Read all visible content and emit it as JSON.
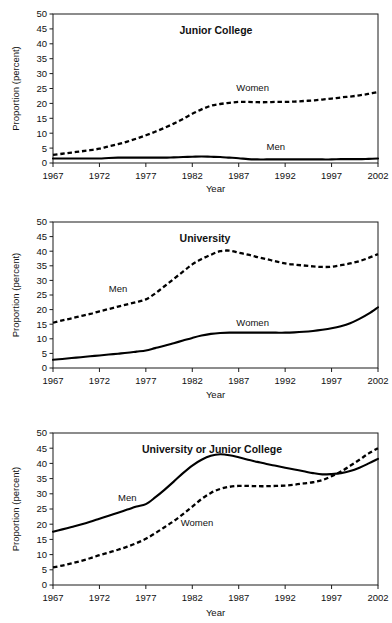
{
  "figure": {
    "background": "#ffffff",
    "line_color": "#000000",
    "axis_color": "#1b1b1b",
    "panel_count": 3
  },
  "shared": {
    "xlabel": "Year",
    "ylabel": "Proportion (percent)",
    "xticks": [
      "1967",
      "1972",
      "1977",
      "1982",
      "1987",
      "1992",
      "1997",
      "2002"
    ],
    "yticks": [
      "0",
      "5",
      "10",
      "15",
      "20",
      "25",
      "30",
      "35",
      "40",
      "45",
      "50"
    ]
  },
  "chart_data": [
    {
      "type": "line",
      "title": "Junior College",
      "xlabel": "Year",
      "ylabel": "Proportion (percent)",
      "xlim": [
        1967,
        2002
      ],
      "ylim": [
        0,
        50
      ],
      "xticks": [
        1967,
        1972,
        1977,
        1982,
        1987,
        1992,
        1997,
        2002
      ],
      "yticks": [
        0,
        5,
        10,
        15,
        20,
        25,
        30,
        35,
        40,
        45,
        50
      ],
      "grid": false,
      "legend_position": "inline-annotations",
      "x": [
        1967,
        1968,
        1969,
        1970,
        1971,
        1972,
        1973,
        1974,
        1975,
        1976,
        1977,
        1978,
        1979,
        1980,
        1981,
        1982,
        1983,
        1984,
        1985,
        1986,
        1987,
        1988,
        1989,
        1990,
        1991,
        1992,
        1993,
        1994,
        1995,
        1996,
        1997,
        1998,
        1999,
        2000,
        2001,
        2002
      ],
      "series": [
        {
          "name": "Women",
          "style": "dashed",
          "label_xy": [
            1988.5,
            24.0
          ],
          "values": [
            2.7,
            3.1,
            3.5,
            3.9,
            4.3,
            4.8,
            5.6,
            6.3,
            7.2,
            8.2,
            9.3,
            10.5,
            11.8,
            13.2,
            14.8,
            16.5,
            18.0,
            19.2,
            19.8,
            20.2,
            20.5,
            20.5,
            20.4,
            20.4,
            20.5,
            20.5,
            20.6,
            20.8,
            21.0,
            21.3,
            21.6,
            22.0,
            22.3,
            22.7,
            23.2,
            23.8
          ]
        },
        {
          "name": "Men",
          "style": "solid",
          "label_xy": [
            1991.0,
            4.2
          ],
          "values": [
            1.5,
            1.5,
            1.5,
            1.5,
            1.5,
            1.5,
            1.7,
            1.8,
            1.8,
            1.8,
            1.8,
            1.8,
            1.8,
            1.9,
            2.0,
            2.1,
            2.2,
            2.1,
            2.0,
            1.8,
            1.6,
            1.3,
            1.2,
            1.2,
            1.2,
            1.2,
            1.2,
            1.2,
            1.2,
            1.2,
            1.2,
            1.3,
            1.3,
            1.3,
            1.4,
            1.5
          ]
        }
      ]
    },
    {
      "type": "line",
      "title": "University",
      "xlabel": "Year",
      "ylabel": "Proportion (percent)",
      "xlim": [
        1967,
        2002
      ],
      "ylim": [
        0,
        50
      ],
      "xticks": [
        1967,
        1972,
        1977,
        1982,
        1987,
        1992,
        1997,
        2002
      ],
      "yticks": [
        0,
        5,
        10,
        15,
        20,
        25,
        30,
        35,
        40,
        45,
        50
      ],
      "grid": false,
      "legend_position": "inline-annotations",
      "x": [
        1967,
        1968,
        1969,
        1970,
        1971,
        1972,
        1973,
        1974,
        1975,
        1976,
        1977,
        1978,
        1979,
        1980,
        1981,
        1982,
        1983,
        1984,
        1985,
        1986,
        1987,
        1988,
        1989,
        1990,
        1991,
        1992,
        1993,
        1994,
        1995,
        1996,
        1997,
        1998,
        1999,
        2000,
        2001,
        2002
      ],
      "series": [
        {
          "name": "Men",
          "style": "dashed",
          "label_xy": [
            1974.0,
            26.0
          ],
          "values": [
            15.5,
            16.3,
            17.0,
            17.8,
            18.5,
            19.4,
            20.2,
            21.0,
            21.8,
            22.6,
            23.5,
            25.5,
            28.0,
            30.5,
            33.0,
            35.5,
            37.3,
            38.8,
            40.0,
            40.2,
            39.5,
            38.8,
            38.0,
            37.3,
            36.5,
            35.8,
            35.4,
            35.1,
            34.8,
            34.6,
            34.7,
            35.2,
            35.8,
            36.6,
            37.7,
            39.0
          ]
        },
        {
          "name": "Women",
          "style": "solid",
          "label_xy": [
            1988.5,
            14.5
          ],
          "values": [
            2.8,
            3.1,
            3.4,
            3.7,
            4.0,
            4.3,
            4.6,
            4.9,
            5.2,
            5.6,
            6.0,
            6.8,
            7.6,
            8.5,
            9.4,
            10.3,
            11.1,
            11.7,
            12.0,
            12.1,
            12.1,
            12.1,
            12.1,
            12.1,
            12.1,
            12.1,
            12.2,
            12.4,
            12.7,
            13.1,
            13.6,
            14.3,
            15.3,
            16.8,
            18.6,
            20.8
          ]
        }
      ]
    },
    {
      "type": "line",
      "title": "University or Junior College",
      "xlabel": "Year",
      "ylabel": "Proportion (percent)",
      "xlim": [
        1967,
        2002
      ],
      "ylim": [
        0,
        50
      ],
      "xticks": [
        1967,
        1972,
        1977,
        1982,
        1987,
        1992,
        1997,
        2002
      ],
      "yticks": [
        0,
        5,
        10,
        15,
        20,
        25,
        30,
        35,
        40,
        45,
        50
      ],
      "grid": false,
      "legend_position": "inline-annotations",
      "x": [
        1967,
        1968,
        1969,
        1970,
        1971,
        1972,
        1973,
        1974,
        1975,
        1976,
        1977,
        1978,
        1979,
        1980,
        1981,
        1982,
        1983,
        1984,
        1985,
        1986,
        1987,
        1988,
        1989,
        1990,
        1991,
        1992,
        1993,
        1994,
        1995,
        1996,
        1997,
        1998,
        1999,
        2000,
        2001,
        2002
      ],
      "series": [
        {
          "name": "Men",
          "style": "solid",
          "label_xy": [
            1975.0,
            27.5
          ],
          "values": [
            17.5,
            18.3,
            19.1,
            19.9,
            20.8,
            21.8,
            22.8,
            23.8,
            24.8,
            25.8,
            26.6,
            28.8,
            31.3,
            34.0,
            36.8,
            39.3,
            41.2,
            42.5,
            43.0,
            42.7,
            42.0,
            41.2,
            40.5,
            39.8,
            39.2,
            38.6,
            38.0,
            37.4,
            36.8,
            36.4,
            36.5,
            36.8,
            37.5,
            38.6,
            40.0,
            41.5
          ]
        },
        {
          "name": "Women",
          "style": "dashed",
          "label_xy": [
            1982.5,
            19.5
          ],
          "values": [
            5.8,
            6.4,
            7.1,
            7.9,
            8.8,
            9.8,
            10.7,
            11.6,
            12.6,
            13.8,
            15.2,
            17.0,
            19.0,
            21.0,
            23.3,
            25.8,
            28.3,
            30.3,
            31.6,
            32.3,
            32.6,
            32.6,
            32.5,
            32.5,
            32.6,
            32.7,
            33.0,
            33.4,
            33.8,
            34.5,
            35.8,
            37.3,
            39.2,
            41.2,
            43.3,
            45.0
          ]
        }
      ]
    }
  ]
}
